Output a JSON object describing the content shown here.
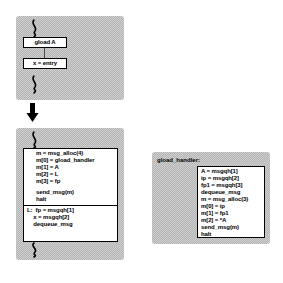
{
  "figure": {
    "type": "code-transformation-diagram",
    "colors": {
      "panel_fill": "#cfcfcf",
      "panel_dither": "#b4b4b4",
      "box_fill": "#ffffff",
      "stroke": "#000000"
    }
  },
  "source_panel": {
    "name": "source-code-panel",
    "top_squiggle": "code-elision-squiggle",
    "bottom_squiggle": "code-elision-squiggle",
    "statements": [
      {
        "id": "gload",
        "text": "gload A"
      },
      {
        "id": "assign-entry",
        "text": "x = entry"
      }
    ],
    "connector": "control-flow-connector"
  },
  "transform_arrow": {
    "name": "transformation-arrow",
    "direction": "down",
    "label": ""
  },
  "target_panel": {
    "name": "transformed-code-panel",
    "top_squiggle": "code-elision-squiggle",
    "bottom_squiggle": "code-elision-squiggle",
    "segments": [
      {
        "id": "send-segment",
        "lines": [
          "m = msg_alloc(4)",
          "m[0] = gload_handler",
          "m[1] = A",
          "m[2] = L",
          "m[3] = fp",
          "",
          "send_msg(m)",
          "halt"
        ]
      },
      {
        "id": "resume-segment",
        "lines": [
          "L:  fp = msgqh[1]",
          "    x = msgqh[2]",
          "    dequeue_msg"
        ]
      }
    ]
  },
  "handler_panel": {
    "name": "gload-handler-panel",
    "caption": "gload_handler:",
    "segments": [
      {
        "id": "handler-body",
        "lines": [
          "A = msgqh[1]",
          "ip = msgqh[2]",
          "fp1 = msgqh[3]",
          "dequeue_msg",
          "m = msg_alloc(3)",
          "m[0] = ip",
          "m[1] = fp1",
          "m[2] = *A",
          "send_msg(m)",
          "halt"
        ]
      }
    ]
  }
}
